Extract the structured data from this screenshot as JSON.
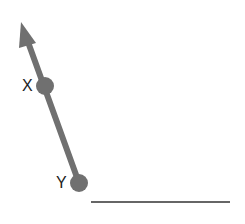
{
  "diagram": {
    "ray_color": "#707070",
    "line_color": "#333333",
    "points": [
      {
        "label": "X",
        "x": 45,
        "y": 86
      },
      {
        "label": "Y",
        "x": 79,
        "y": 183
      }
    ],
    "arrow_tip": {
      "x": 21,
      "y": 22
    },
    "segment": {
      "x1": 91,
      "y1": 202,
      "x2": 230,
      "y2": 202
    }
  }
}
